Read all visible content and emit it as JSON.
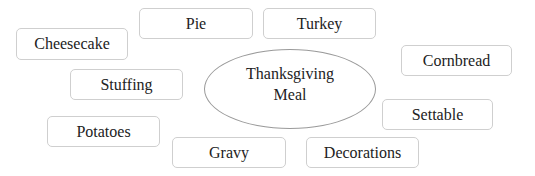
{
  "diagram": {
    "type": "mind-map",
    "center": {
      "line1": "Thanksgiving",
      "line2": "Meal"
    },
    "nodes": [
      {
        "label": "Pie"
      },
      {
        "label": "Turkey"
      },
      {
        "label": "Cheesecake"
      },
      {
        "label": "Stuffing"
      },
      {
        "label": "Cornbread"
      },
      {
        "label": "Settable"
      },
      {
        "label": "Potatoes"
      },
      {
        "label": "Gravy"
      },
      {
        "label": "Decorations"
      }
    ]
  }
}
